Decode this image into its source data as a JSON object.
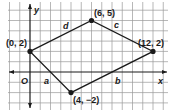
{
  "figure": {
    "type": "coordinate-plane-quadrilateral",
    "axes": {
      "x_label": "x",
      "y_label": "y",
      "origin_label": "O"
    },
    "grid": {
      "x_min": -2,
      "x_max": 14,
      "y_min": -3,
      "y_max": 6
    },
    "vertices": [
      {
        "id": "A",
        "x": 0,
        "y": 2,
        "label": "(0, 2)"
      },
      {
        "id": "B",
        "x": 6,
        "y": 5,
        "label": "(6, 5)"
      },
      {
        "id": "C",
        "x": 12,
        "y": 2,
        "label": "(12, 2)"
      },
      {
        "id": "D",
        "x": 4,
        "y": -2,
        "label": "(4, −2)"
      }
    ],
    "sides": [
      {
        "name": "d",
        "from": "A",
        "to": "B"
      },
      {
        "name": "c",
        "from": "B",
        "to": "C"
      },
      {
        "name": "b",
        "from": "C",
        "to": "D"
      },
      {
        "name": "a",
        "from": "D",
        "to": "A"
      }
    ],
    "colors": {
      "grid": "#9a9a9a",
      "line": "#1a1a1a",
      "background": "#ffffff"
    }
  }
}
